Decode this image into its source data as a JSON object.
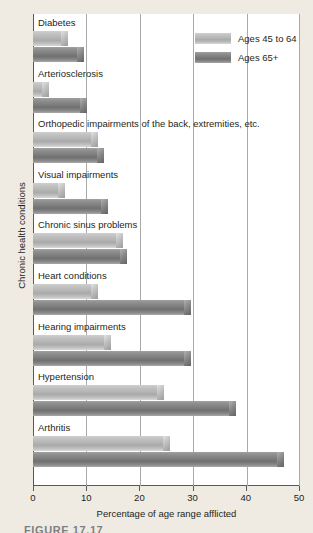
{
  "chart_data": {
    "type": "bar",
    "orientation": "horizontal",
    "title": "",
    "xlabel": "Percentage of age range afflicted",
    "ylabel": "Chronic health conditions",
    "xlim": [
      0,
      50
    ],
    "xticks": [
      0,
      10,
      20,
      30,
      40,
      50
    ],
    "xtick_labels": [
      "0",
      "10",
      "20",
      "30",
      "40",
      "50"
    ],
    "grid": "vertical",
    "legend_position": "top-right",
    "categories": [
      "Diabetes",
      "Arteriosclerosis",
      "Orthopedic impairments of the back, extremities, etc.",
      "Visual impairments",
      "Chronic sinus problems",
      "Heart conditions",
      "Hearing impairments",
      "Hypertension",
      "Arthritis"
    ],
    "series": [
      {
        "name": "Ages 45 to 64",
        "color": "#b4b4b4",
        "values": [
          6.4,
          2.8,
          12.0,
          5.8,
          16.7,
          12.0,
          14.5,
          24.5,
          25.5
        ]
      },
      {
        "name": "Ages 65+",
        "color": "#7c7c7c",
        "values": [
          9.4,
          10.0,
          13.1,
          14.0,
          17.5,
          29.5,
          29.5,
          38.0,
          47.0
        ]
      }
    ]
  },
  "legend": {
    "items": [
      {
        "label": "Ages 45 to 64"
      },
      {
        "label": "Ages 65+"
      }
    ]
  },
  "caption": "FIGURE 17.17"
}
